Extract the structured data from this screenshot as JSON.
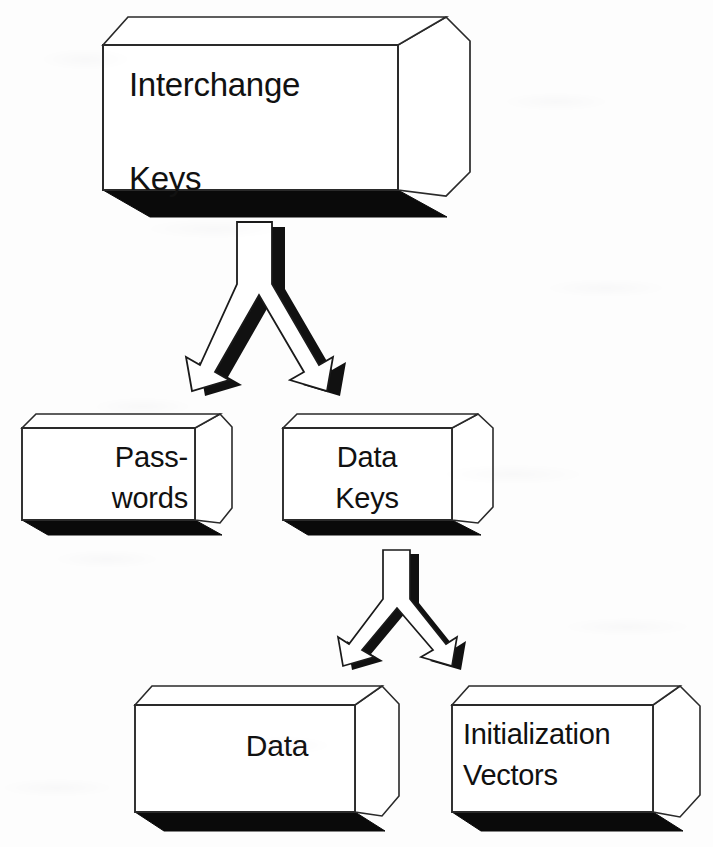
{
  "diagram": {
    "type": "flow-diagram",
    "background_color": "#fdfdfd",
    "box_fill_color": "#ffffff",
    "box_stroke_color": "#1a1a1a",
    "shadow_color": "#0a0a0a",
    "arrow_fill_color": "#ffffff",
    "arrow_stroke_color": "#1a1a1a",
    "nodes": [
      {
        "id": "interchange-keys",
        "name": "interchange-keys-box",
        "lines": [
          "Interchange",
          "Keys"
        ],
        "line1": "Interchange",
        "line2": "Keys",
        "level": 1
      },
      {
        "id": "passwords",
        "name": "passwords-box",
        "lines": [
          "Pass-",
          "words"
        ],
        "line1": "Pass-",
        "line2": "words",
        "level": 2
      },
      {
        "id": "data-keys",
        "name": "data-keys-box",
        "lines": [
          "Data",
          "Keys"
        ],
        "line1": "Data",
        "line2": "Keys",
        "level": 2
      },
      {
        "id": "data",
        "name": "data-box",
        "lines": [
          "Data"
        ],
        "line1": "Data",
        "line2": "",
        "level": 3
      },
      {
        "id": "initialization-vectors",
        "name": "initialization-vectors-box",
        "lines": [
          "Initialization",
          "Vectors"
        ],
        "line1": "Initialization",
        "line2": "Vectors",
        "level": 3
      }
    ],
    "connectors": [
      {
        "id": "fork-top",
        "name": "forked-arrow-interchange-to-children",
        "kind": "forked-arrow",
        "from": "interchange-keys",
        "to": [
          "passwords",
          "data-keys"
        ]
      },
      {
        "id": "fork-bottom",
        "name": "forked-arrow-datakeys-to-children",
        "kind": "forked-arrow",
        "from": "data-keys",
        "to": [
          "data",
          "initialization-vectors"
        ]
      }
    ]
  }
}
